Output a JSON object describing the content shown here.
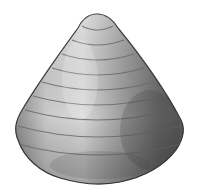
{
  "image": {
    "subject": "conical gastropod shell",
    "style": "grayscale illustration",
    "background": "#ffffff",
    "colors": {
      "light": "#d8d8d8",
      "mid": "#9a9a9a",
      "dark": "#4a4a4a",
      "outline": "#3a3a3a"
    },
    "growth_rings": 9
  }
}
